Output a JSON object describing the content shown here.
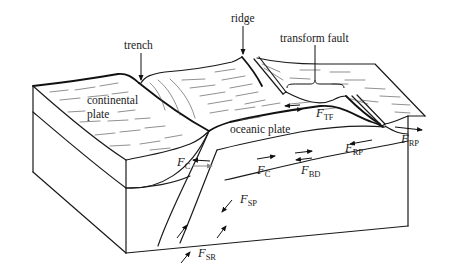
{
  "figure": {
    "labels": {
      "ridge": "ridge",
      "trench": "trench",
      "transform_fault": "transform fault",
      "continental_plate_line1": "continental",
      "continental_plate_line2": "plate",
      "oceanic_plate": "oceanic plate"
    },
    "forces": {
      "f_tf": {
        "symbol": "F",
        "sub": "TF"
      },
      "f_rp_ridge": {
        "symbol": "F",
        "sub": "RP"
      },
      "f_rp_base": {
        "symbol": "F",
        "sub": "RP"
      },
      "f_bd": {
        "symbol": "F",
        "sub": "BD"
      },
      "f_c_left": {
        "symbol": "F",
        "sub": "C"
      },
      "f_c_right": {
        "symbol": "F",
        "sub": "C"
      },
      "f_sp": {
        "symbol": "F",
        "sub": "SP"
      },
      "f_sr": {
        "symbol": "F",
        "sub": "SR"
      }
    },
    "colors": {
      "line": "#1a1a1a",
      "background": "#ffffff",
      "secondary_arrow": "#888888"
    }
  }
}
